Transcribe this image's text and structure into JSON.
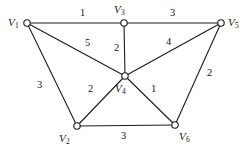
{
  "figure": {
    "type": "weighted-undirected-graph",
    "background_color": "#ffffff",
    "stroke_color": "#1c1c1c",
    "text_color": "#16181a"
  },
  "nodes": [
    {
      "id": "V1",
      "label": "V",
      "sub": "1",
      "x": 27,
      "y": 23,
      "label_x": 8,
      "label_y": 17,
      "radius": 3.2
    },
    {
      "id": "V2",
      "label": "V",
      "sub": "2",
      "x": 77,
      "y": 126,
      "label_x": 59,
      "label_y": 133,
      "radius": 3.2
    },
    {
      "id": "V3",
      "label": "V",
      "sub": "3",
      "x": 124,
      "y": 23,
      "label_x": 114,
      "label_y": 4,
      "radius": 3.2
    },
    {
      "id": "V4",
      "label": "V",
      "sub": "4",
      "x": 125,
      "y": 76,
      "label_x": 115,
      "label_y": 83,
      "radius": 3.2
    },
    {
      "id": "V5",
      "label": "V",
      "sub": "5",
      "x": 221,
      "y": 23,
      "label_x": 228,
      "label_y": 17,
      "radius": 3.2
    },
    {
      "id": "V6",
      "label": "V",
      "sub": "6",
      "x": 175,
      "y": 125,
      "label_x": 179,
      "label_y": 131,
      "radius": 3.2
    }
  ],
  "edges": [
    {
      "from": "V1",
      "to": "V3",
      "weight": "1",
      "x1": 27,
      "y1": 23,
      "x2": 124,
      "y2": 23,
      "label_x": 80,
      "label_y": 8
    },
    {
      "from": "V3",
      "to": "V5",
      "weight": "3",
      "x1": 124,
      "y1": 23,
      "x2": 221,
      "y2": 23,
      "label_x": 170,
      "label_y": 8
    },
    {
      "from": "V1",
      "to": "V4",
      "weight": "5",
      "x1": 27,
      "y1": 23,
      "x2": 125,
      "y2": 76,
      "label_x": 85,
      "label_y": 38
    },
    {
      "from": "V3",
      "to": "V4",
      "weight": "2",
      "x1": 124,
      "y1": 23,
      "x2": 125,
      "y2": 76,
      "label_x": 114,
      "label_y": 43
    },
    {
      "from": "V4",
      "to": "V5",
      "weight": "4",
      "x1": 125,
      "y1": 76,
      "x2": 221,
      "y2": 23,
      "label_x": 166,
      "label_y": 37
    },
    {
      "from": "V1",
      "to": "V2",
      "weight": "3",
      "x1": 27,
      "y1": 23,
      "x2": 77,
      "y2": 126,
      "label_x": 37,
      "label_y": 80
    },
    {
      "from": "V2",
      "to": "V4",
      "weight": "2",
      "x1": 77,
      "y1": 126,
      "x2": 125,
      "y2": 76,
      "label_x": 88,
      "label_y": 84
    },
    {
      "from": "V4",
      "to": "V6",
      "weight": "1",
      "x1": 125,
      "y1": 76,
      "x2": 175,
      "y2": 125,
      "label_x": 151,
      "label_y": 84
    },
    {
      "from": "V5",
      "to": "V6",
      "weight": "2",
      "x1": 221,
      "y1": 23,
      "x2": 175,
      "y2": 125,
      "label_x": 207,
      "label_y": 68
    },
    {
      "from": "V2",
      "to": "V6",
      "weight": "3",
      "x1": 77,
      "y1": 126,
      "x2": 175,
      "y2": 125,
      "label_x": 121,
      "label_y": 131
    }
  ]
}
